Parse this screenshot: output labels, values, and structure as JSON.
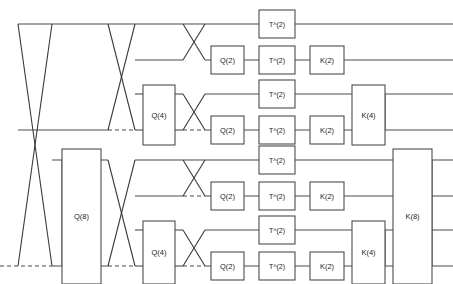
{
  "diagram": {
    "width": 453,
    "height": 284,
    "background_color": "#ffffff",
    "wire_color": "#4d4d4d",
    "gate_fill": "#ffffff",
    "gate_stroke": "#4d4d4d",
    "label_color": "#1a1a1a",
    "wire_count": 8,
    "wire_y": [
      24,
      60,
      94,
      130,
      160,
      196,
      230,
      266
    ],
    "labels": {
      "q2": "Q(2)",
      "q4": "Q(4)",
      "q8": "Q(8)",
      "t2": "T^(2)",
      "k2": "K(2)",
      "k4": "K(4)",
      "k8": "K(8)"
    },
    "gates": [
      {
        "name": "q8-gate",
        "label": "Q(8)",
        "x": 62,
        "y": 149,
        "w": 39,
        "h": 135
      },
      {
        "name": "q4-gate-upper",
        "label": "Q(4)",
        "x": 143,
        "y": 85,
        "w": 32,
        "h": 60
      },
      {
        "name": "q4-gate-lower",
        "label": "Q(4)",
        "x": 143,
        "y": 221,
        "w": 32,
        "h": 63
      },
      {
        "name": "q2-gate-1",
        "label": "Q(2)",
        "x": 211,
        "y": 46,
        "w": 33,
        "h": 28
      },
      {
        "name": "q2-gate-2",
        "label": "Q(2)",
        "x": 211,
        "y": 116,
        "w": 33,
        "h": 28
      },
      {
        "name": "q2-gate-3",
        "label": "Q(2)",
        "x": 211,
        "y": 182,
        "w": 33,
        "h": 28
      },
      {
        "name": "q2-gate-4",
        "label": "Q(2)",
        "x": 211,
        "y": 252,
        "w": 33,
        "h": 28
      },
      {
        "name": "t2-gate-1",
        "label": "T^(2)",
        "x": 259,
        "y": 10,
        "w": 36,
        "h": 28
      },
      {
        "name": "t2-gate-2",
        "label": "T^(2)",
        "x": 259,
        "y": 46,
        "w": 36,
        "h": 28
      },
      {
        "name": "t2-gate-3",
        "label": "T^(2)",
        "x": 259,
        "y": 80,
        "w": 36,
        "h": 28
      },
      {
        "name": "t2-gate-4",
        "label": "T^(2)",
        "x": 259,
        "y": 116,
        "w": 36,
        "h": 28
      },
      {
        "name": "t2-gate-5",
        "label": "T^(2)",
        "x": 259,
        "y": 146,
        "w": 36,
        "h": 28
      },
      {
        "name": "t2-gate-6",
        "label": "T^(2)",
        "x": 259,
        "y": 182,
        "w": 36,
        "h": 28
      },
      {
        "name": "t2-gate-7",
        "label": "T^(2)",
        "x": 259,
        "y": 216,
        "w": 36,
        "h": 28
      },
      {
        "name": "t2-gate-8",
        "label": "T^(2)",
        "x": 259,
        "y": 252,
        "w": 36,
        "h": 28
      },
      {
        "name": "k2-gate-1",
        "label": "K(2)",
        "x": 310,
        "y": 46,
        "w": 34,
        "h": 28
      },
      {
        "name": "k2-gate-2",
        "label": "K(2)",
        "x": 310,
        "y": 116,
        "w": 34,
        "h": 28
      },
      {
        "name": "k2-gate-3",
        "label": "K(2)",
        "x": 310,
        "y": 182,
        "w": 34,
        "h": 28
      },
      {
        "name": "k2-gate-4",
        "label": "K(2)",
        "x": 310,
        "y": 252,
        "w": 34,
        "h": 28
      },
      {
        "name": "k4-gate-upper",
        "label": "K(4)",
        "x": 352,
        "y": 85,
        "w": 33,
        "h": 60
      },
      {
        "name": "k4-gate-lower",
        "label": "K(4)",
        "x": 352,
        "y": 221,
        "w": 33,
        "h": 63
      },
      {
        "name": "k8-gate",
        "label": "K(8)",
        "x": 393,
        "y": 149,
        "w": 39,
        "h": 135
      }
    ],
    "wire_segments": [
      {
        "name": "wire-0-seg-a",
        "x1": 18,
        "y1": 24,
        "x2": 453,
        "y2": 24
      },
      {
        "name": "wire-1-seg-a",
        "x1": 135,
        "y1": 60,
        "x2": 183,
        "y2": 60
      },
      {
        "name": "wire-1-seg-b",
        "x1": 205,
        "y1": 60,
        "x2": 453,
        "y2": 60
      },
      {
        "name": "wire-2-seg-a",
        "x1": 135,
        "y1": 94,
        "x2": 143,
        "y2": 94
      },
      {
        "name": "wire-2-seg-b",
        "x1": 175,
        "y1": 94,
        "x2": 183,
        "y2": 94
      },
      {
        "name": "wire-2-seg-c",
        "x1": 205,
        "y1": 94,
        "x2": 453,
        "y2": 94
      },
      {
        "name": "wire-3-seg-a",
        "x1": 18,
        "y1": 130,
        "x2": 108,
        "y2": 130
      },
      {
        "name": "wire-3-seg-b",
        "x1": 135,
        "y1": 130,
        "x2": 143,
        "y2": 130
      },
      {
        "name": "wire-3-seg-c",
        "x1": 175,
        "y1": 130,
        "x2": 183,
        "y2": 130
      },
      {
        "name": "wire-3-seg-d",
        "x1": 205,
        "y1": 130,
        "x2": 453,
        "y2": 130
      },
      {
        "name": "wire-4-seg-a",
        "x1": 52,
        "y1": 160,
        "x2": 108,
        "y2": 160
      },
      {
        "name": "wire-4-seg-b",
        "x1": 135,
        "y1": 160,
        "x2": 453,
        "y2": 160
      },
      {
        "name": "wire-5-seg-a",
        "x1": 135,
        "y1": 196,
        "x2": 183,
        "y2": 196
      },
      {
        "name": "wire-5-seg-b",
        "x1": 205,
        "y1": 196,
        "x2": 453,
        "y2": 196
      },
      {
        "name": "wire-6-seg-a",
        "x1": 135,
        "y1": 230,
        "x2": 143,
        "y2": 230
      },
      {
        "name": "wire-6-seg-b",
        "x1": 175,
        "y1": 230,
        "x2": 183,
        "y2": 230
      },
      {
        "name": "wire-6-seg-c",
        "x1": 205,
        "y1": 230,
        "x2": 453,
        "y2": 230
      },
      {
        "name": "wire-7-seg-a",
        "x1": 52,
        "y1": 266,
        "x2": 108,
        "y2": 266
      },
      {
        "name": "wire-7-seg-b",
        "x1": 135,
        "y1": 266,
        "x2": 143,
        "y2": 266
      },
      {
        "name": "wire-7-seg-c",
        "x1": 175,
        "y1": 266,
        "x2": 183,
        "y2": 266
      },
      {
        "name": "wire-7-seg-d",
        "x1": 205,
        "y1": 266,
        "x2": 453,
        "y2": 266
      }
    ],
    "dashed_segments": [
      {
        "name": "dashed-wire-7-left",
        "x1": 0,
        "y1": 266,
        "x2": 52,
        "y2": 266
      },
      {
        "name": "dashed-wire-3-mid",
        "x1": 108,
        "y1": 130,
        "x2": 135,
        "y2": 130
      },
      {
        "name": "dashed-wire-7-mid",
        "x1": 108,
        "y1": 266,
        "x2": 135,
        "y2": 266
      },
      {
        "name": "dashed-wire-3-right",
        "x1": 183,
        "y1": 130,
        "x2": 205,
        "y2": 130
      },
      {
        "name": "dashed-wire-5-right",
        "x1": 183,
        "y1": 196,
        "x2": 205,
        "y2": 196
      },
      {
        "name": "dashed-wire-7-right",
        "x1": 183,
        "y1": 266,
        "x2": 205,
        "y2": 266
      }
    ],
    "crossings": [
      {
        "name": "swap-level-8",
        "x1": 18,
        "x2": 52,
        "ytop": 24,
        "ybot": 266
      },
      {
        "name": "swap-level-4-upper",
        "x1": 108,
        "x2": 135,
        "ytop": 24,
        "ybot": 130
      },
      {
        "name": "swap-level-4-lower",
        "x1": 108,
        "x2": 135,
        "ytop": 160,
        "ybot": 266
      },
      {
        "name": "swap-level-2-a",
        "x1": 183,
        "x2": 205,
        "ytop": 24,
        "ybot": 60
      },
      {
        "name": "swap-level-2-b",
        "x1": 183,
        "x2": 205,
        "ytop": 94,
        "ybot": 130
      },
      {
        "name": "swap-level-2-c",
        "x1": 183,
        "x2": 205,
        "ytop": 160,
        "ybot": 196
      },
      {
        "name": "swap-level-2-d",
        "x1": 183,
        "x2": 205,
        "ytop": 230,
        "ybot": 266
      }
    ],
    "bus_links": [
      {
        "name": "k4-upper-bus",
        "x": 385,
        "ytop": 94,
        "ybot": 130
      },
      {
        "name": "k4-lower-bus",
        "x": 385,
        "ytop": 230,
        "ybot": 266
      },
      {
        "name": "k8-out-bus",
        "x": 432,
        "ytop": 160,
        "ybot": 266
      },
      {
        "name": "q8-in-bus",
        "x": 62,
        "ytop": 160,
        "ybot": 266
      }
    ]
  }
}
